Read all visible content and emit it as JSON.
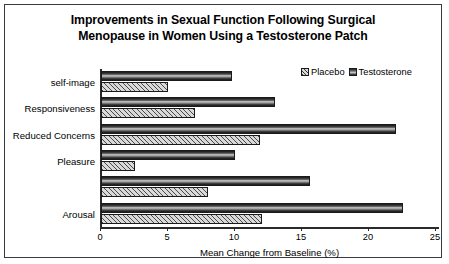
{
  "chart_data": {
    "type": "bar",
    "orientation": "horizontal",
    "title": "Improvements in Sexual Function Following Surgical Menopause in Women Using a Testosterone Patch",
    "title_line1": "Improvements in Sexual Function Following Surgical",
    "title_line2": "Menopause in Women Using a Testosterone Patch",
    "xlabel": "Mean Change from Baseline (%)",
    "ylabel": "",
    "xlim": [
      0,
      25
    ],
    "xticks": [
      0,
      5,
      10,
      15,
      20,
      25
    ],
    "xticklabels": [
      "0",
      "5",
      "10",
      "15",
      "20",
      "25"
    ],
    "grid": false,
    "legend_position": "top-right",
    "categories": [
      "self-image",
      "Responsiveness",
      "Reduced Concerns",
      "Pleasure",
      "",
      "Arousal"
    ],
    "series": [
      {
        "name": "Placebo",
        "color": "#d9d9d9",
        "pattern": "diagonal-hatch",
        "values": [
          5.0,
          7.0,
          11.9,
          2.5,
          8.0,
          12.0
        ]
      },
      {
        "name": "Testosterone",
        "color": "#1d1d1d",
        "pattern": "vertical-gradient",
        "values": [
          9.8,
          13.0,
          22.0,
          10.0,
          15.6,
          22.5
        ]
      }
    ]
  },
  "legend": {
    "items": [
      {
        "label": "Placebo"
      },
      {
        "label": "Testosterone"
      }
    ]
  },
  "colors": {
    "border": "#3a3a3a",
    "axis": "#2a2a2a",
    "background": "#ffffff"
  }
}
